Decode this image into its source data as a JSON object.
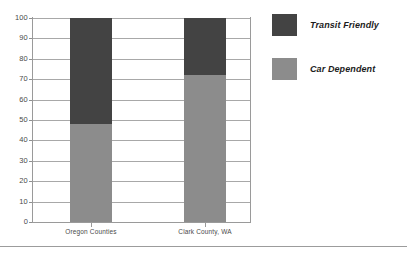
{
  "chart_data": {
    "type": "bar",
    "subtype": "stacked-100-percent",
    "title": "",
    "subtitle": "",
    "xlabel": "",
    "ylabel": "",
    "categories": [
      "Oregon Counties",
      "Clark County, WA"
    ],
    "series": [
      {
        "name": "Car Dependent",
        "values": [
          48,
          72
        ],
        "color": "#8c8c8c"
      },
      {
        "name": "Transit Friendly",
        "values": [
          52,
          28
        ],
        "color": "#434343"
      }
    ],
    "stack_order": [
      "Car Dependent",
      "Transit Friendly"
    ],
    "ylim": [
      0,
      100
    ],
    "ytick_step": 10,
    "yticks": [
      100,
      90,
      80,
      70,
      60,
      50,
      40,
      30,
      20,
      10,
      0
    ],
    "ytick_labels": [
      "100",
      "90",
      "80",
      "70",
      "60",
      "50",
      "40",
      "30",
      "20",
      "10",
      "0"
    ],
    "grid": true,
    "grid_axis": "y",
    "legend": true,
    "legend_position": "right",
    "legend_entries": [
      {
        "label": "Transit Friendly",
        "color": "#434343"
      },
      {
        "label": "Car Dependent",
        "color": "#8c8c8c"
      }
    ],
    "bar_tops": [
      100,
      100
    ],
    "annotations": []
  },
  "colors": {
    "transit_friendly": "#434343",
    "car_dependent": "#8c8c8c",
    "axis": "#9a9a9a",
    "gridline": "#a8a8a8",
    "text": "#4a4a4a",
    "legend_text": "#1c1c1c",
    "background": "#ffffff",
    "rule": "#9c9c9c"
  }
}
